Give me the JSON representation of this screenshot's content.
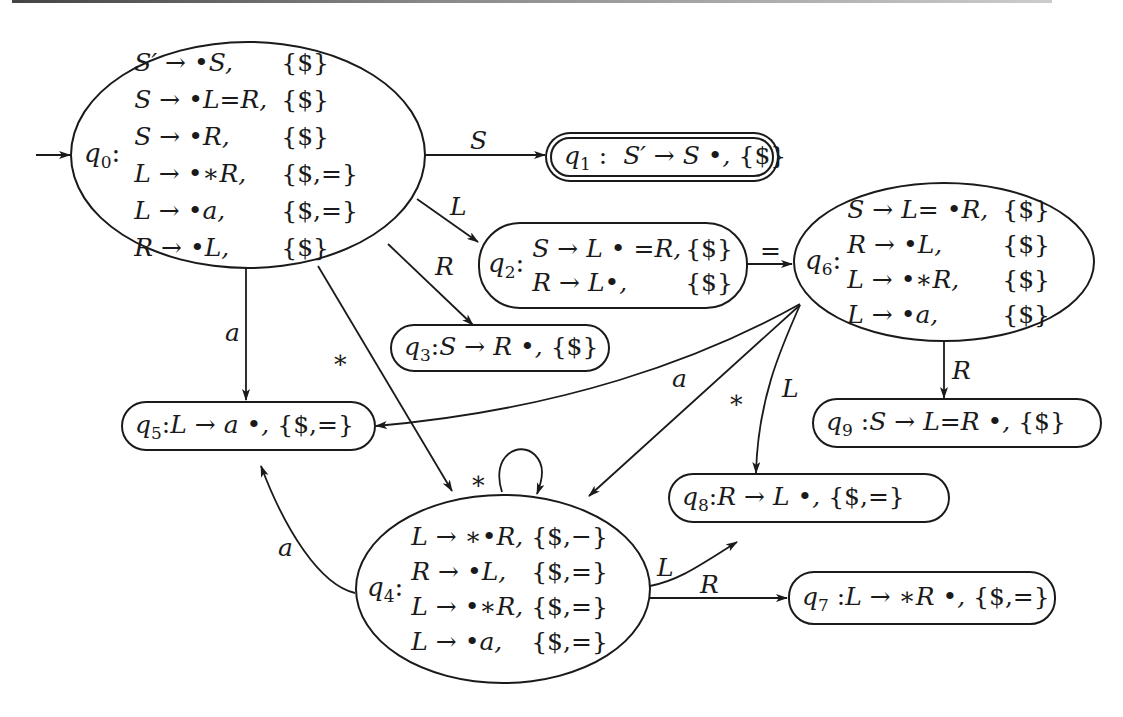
{
  "diagram": {
    "start_state": "q0",
    "accept_state": "q1",
    "states": [
      {
        "id": "q0",
        "label": "q",
        "sub": "0",
        "items": [
          {
            "prod": "S′ → •S,",
            "la": "{$}"
          },
          {
            "prod": "S → •L=R,",
            "la": "{$}"
          },
          {
            "prod": "S → •R,",
            "la": "{$}"
          },
          {
            "prod": "L → •∗R,",
            "la": "{$,=}"
          },
          {
            "prod": "L → •a,",
            "la": "{$,=}"
          },
          {
            "prod": "R → •L,",
            "la": "{$}"
          }
        ]
      },
      {
        "id": "q1",
        "label": "q",
        "sub": "1",
        "text": "S′ → S •,",
        "la": "{$}"
      },
      {
        "id": "q2",
        "label": "q",
        "sub": "2",
        "items": [
          {
            "prod": "S → L • =R,",
            "la": "{$}"
          },
          {
            "prod": "R → L•,",
            "la": "{$}"
          }
        ]
      },
      {
        "id": "q3",
        "label": "q",
        "sub": "3",
        "text": "S → R •,",
        "la": "{$}"
      },
      {
        "id": "q4",
        "label": "q",
        "sub": "4",
        "items": [
          {
            "prod": "L → ∗•R,",
            "la": "{$,−}"
          },
          {
            "prod": "R → •L,",
            "la": "{$,=}"
          },
          {
            "prod": "L → •∗R,",
            "la": "{$,=}"
          },
          {
            "prod": "L → •a,",
            "la": "{$,=}"
          }
        ]
      },
      {
        "id": "q5",
        "label": "q",
        "sub": "5",
        "text": "L → a •,",
        "la": "{$,=}"
      },
      {
        "id": "q6",
        "label": "q",
        "sub": "6",
        "items": [
          {
            "prod": "S → L= •R,",
            "la": "{$}"
          },
          {
            "prod": "R → •L,",
            "la": "{$}"
          },
          {
            "prod": "L → •∗R,",
            "la": "{$}"
          },
          {
            "prod": "L → •a,",
            "la": "{$}"
          }
        ]
      },
      {
        "id": "q7",
        "label": "q",
        "sub": "7",
        "text": "L → ∗R •,",
        "la": "{$,=}"
      },
      {
        "id": "q8",
        "label": "q",
        "sub": "8",
        "text": "R → L •,",
        "la": "{$,=}"
      },
      {
        "id": "q9",
        "label": "q",
        "sub": "9",
        "text": "S → L=R •,",
        "la": "{$}"
      }
    ],
    "colon": ":",
    "transitions": [
      {
        "from": "q0",
        "to": "q1",
        "symbol": "S"
      },
      {
        "from": "q0",
        "to": "q2",
        "symbol": "L"
      },
      {
        "from": "q0",
        "to": "q3",
        "symbol": "R"
      },
      {
        "from": "q0",
        "to": "q5",
        "symbol": "a"
      },
      {
        "from": "q0",
        "to": "q4",
        "symbol": "∗"
      },
      {
        "from": "q2",
        "to": "q6",
        "symbol": "="
      },
      {
        "from": "q6",
        "to": "q9",
        "symbol": "R"
      },
      {
        "from": "q6",
        "to": "q5",
        "symbol": "a"
      },
      {
        "from": "q6",
        "to": "q4",
        "symbol": "∗"
      },
      {
        "from": "q6",
        "to": "q8",
        "symbol": "L"
      },
      {
        "from": "q4",
        "to": "q4",
        "symbol": "∗"
      },
      {
        "from": "q4",
        "to": "q5",
        "symbol": "a"
      },
      {
        "from": "q4",
        "to": "q8",
        "symbol": "L"
      },
      {
        "from": "q4",
        "to": "q7",
        "symbol": "R"
      }
    ]
  }
}
